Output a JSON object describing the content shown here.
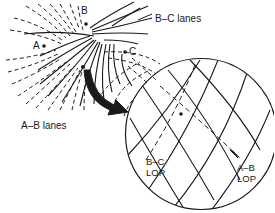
{
  "diagram": {
    "type": "hyperbolic-navigation-lanes",
    "stations": [
      {
        "id": "A",
        "label": "A",
        "x": 40,
        "y": 46
      },
      {
        "id": "B",
        "label": "B",
        "x": 86,
        "y": 22
      },
      {
        "id": "C",
        "label": "C",
        "x": 125,
        "y": 52
      }
    ],
    "labels": {
      "bc_lanes": "B–C lanes",
      "ab_lanes": "A–B lanes",
      "bc_lop_line1": "B–C",
      "bc_lop_line2": "LOP",
      "ab_lop_line1": "A–B",
      "ab_lop_line2": "LOP"
    },
    "fix_point": {
      "x": 83,
      "y": 67
    },
    "zoom_circle": {
      "cx": 201,
      "cy": 134,
      "r": 76
    },
    "colors": {
      "ink": "#1a1a1a",
      "background": "#ffffff"
    }
  }
}
